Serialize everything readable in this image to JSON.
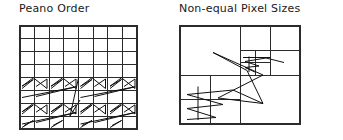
{
  "figure": {
    "background": "#ffffff",
    "ink_color": "#2b2b2b",
    "path_color": "#111111",
    "width": 343,
    "height": 140
  },
  "panels": [
    {
      "id": "peano-order",
      "title": "Peano Order",
      "grid": {
        "type": "uniform",
        "columns": 8,
        "rows": 8,
        "x": 20,
        "y": 26,
        "width": 117,
        "height": 103
      },
      "curve": {
        "name": "peano-scan-path",
        "description": "zigzag scan traversal drawn over lower half of grid"
      }
    },
    {
      "id": "non-equal-pixel-sizes",
      "title": "Non-equal Pixel Sizes",
      "grid": {
        "type": "quadtree",
        "x": 9,
        "y": 26,
        "width": 120,
        "height": 98,
        "subdivisions": [
          {
            "x": 0,
            "y": 0,
            "w": 60,
            "h": 49
          },
          {
            "x": 60,
            "y": 0,
            "w": 30,
            "h": 24.5
          },
          {
            "x": 90,
            "y": 0,
            "w": 30,
            "h": 24.5
          },
          {
            "x": 60,
            "y": 24.5,
            "w": 15,
            "h": 12.25
          },
          {
            "x": 75,
            "y": 24.5,
            "w": 15,
            "h": 12.25
          },
          {
            "x": 60,
            "y": 36.75,
            "w": 15,
            "h": 12.25
          },
          {
            "x": 75,
            "y": 36.75,
            "w": 15,
            "h": 12.25
          },
          {
            "x": 90,
            "y": 24.5,
            "w": 30,
            "h": 24.5
          },
          {
            "x": 0,
            "y": 49,
            "w": 30,
            "h": 24.5
          },
          {
            "x": 30,
            "y": 49,
            "w": 30,
            "h": 24.5
          },
          {
            "x": 0,
            "y": 73.5,
            "w": 30,
            "h": 24.5
          },
          {
            "x": 30,
            "y": 73.5,
            "w": 30,
            "h": 24.5
          },
          {
            "x": 60,
            "y": 49,
            "w": 60,
            "h": 49
          }
        ]
      },
      "curve": {
        "name": "adaptive-scan-path",
        "description": "traversal path across non-uniform quadtree cells"
      }
    }
  ]
}
